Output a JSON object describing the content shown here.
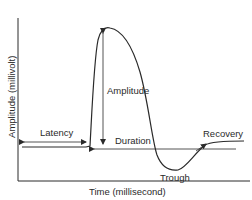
{
  "diagram": {
    "title": "",
    "xlabel": "Time (millisecond)",
    "ylabel": "Amplitude (millivolt)",
    "annotations": {
      "latency": "Latency",
      "amplitude": "Amplitude",
      "duration": "Duration",
      "recovery": "Recovery",
      "trough": "Trough"
    },
    "colors": {
      "line": "#2a2a2a",
      "background": "#ffffff"
    }
  }
}
